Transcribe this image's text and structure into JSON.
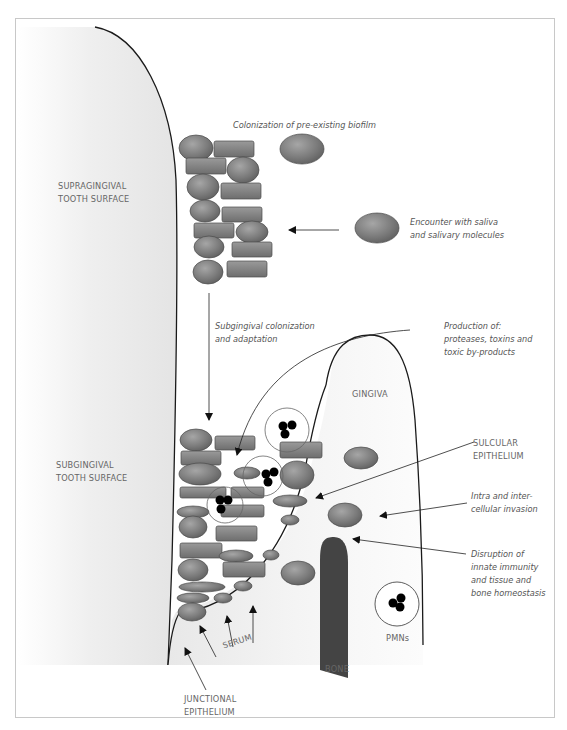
{
  "diagram": {
    "labels": {
      "supragingival": "SUPRAGINGIVAL\nTOOTH SURFACE",
      "subgingival": "SUBGINGIVAL\nTOOTH SURFACE",
      "colonization_preexisting": "Colonization of pre-existing biofilm",
      "encounter_saliva": "Encounter with saliva\nand salivary molecules",
      "subgingival_colonization": "Subgingival colonization\nand adaptation",
      "production_of": "Production of:\nproteases, toxins and\ntoxic by-products",
      "gingiva": "GINGIVA",
      "sulcular_epithelium": "SULCULAR\nEPITHELIUM",
      "invasion": "Intra and inter-\ncellular invasion",
      "disruption": "Disruption of\ninnate immunity\nand tissue and\nbone homeostasis",
      "pmns": "PMNs",
      "bone": "BONE",
      "serum": "SERUM",
      "junctional_epithelium": "JUNCTIONAL\nEPITHELIUM"
    },
    "colors": {
      "bacteria_fill": "#7d7d7d",
      "bacteria_stroke": "#4a4a4a",
      "bone": "#444444",
      "tooth_gradient_light": "#ffffff",
      "tooth_gradient_dark": "#e6e6e6",
      "outline": "#1a1a1a",
      "label_text": "#555555",
      "frame": "#c8c8c8"
    }
  }
}
